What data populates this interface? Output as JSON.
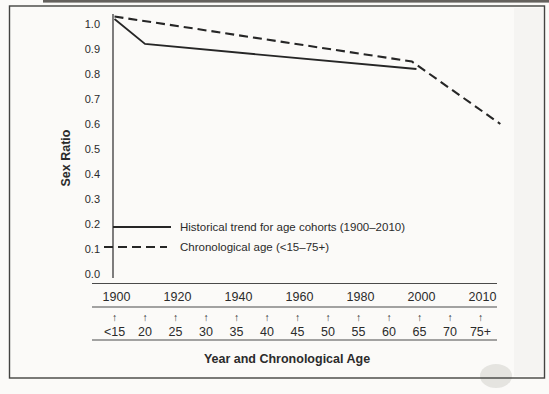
{
  "colors": {
    "ink": "#2b2b2b",
    "paper": "#fbfaf8"
  },
  "icons": {
    "up_arrow": "↑"
  },
  "chart_data": {
    "type": "line",
    "title": "",
    "ylabel": "Sex Ratio",
    "xlabel": "Year and Chronological Age",
    "ylim": [
      0.0,
      1.05
    ],
    "grid": false,
    "legend_position": "inside lower-left",
    "y_ticks": [
      {
        "label": "1.0",
        "value": 1.0
      },
      {
        "label": "0.9",
        "value": 0.9
      },
      {
        "label": "0.8",
        "value": 0.8
      },
      {
        "label": "0.7",
        "value": 0.7
      },
      {
        "label": "0.6",
        "value": 0.6
      },
      {
        "label": "0.5",
        "value": 0.5
      },
      {
        "label": "0.4",
        "value": 0.4
      },
      {
        "label": "0.3",
        "value": 0.3
      },
      {
        "label": "0.2",
        "value": 0.2
      },
      {
        "label": "0.1",
        "value": 0.1
      },
      {
        "label": "0.0",
        "value": 0.0
      }
    ],
    "x_axis": {
      "year_row": [
        {
          "label": "1900",
          "pos": 0
        },
        {
          "label": "1920",
          "pos": 2
        },
        {
          "label": "1940",
          "pos": 4
        },
        {
          "label": "1960",
          "pos": 6
        },
        {
          "label": "1980",
          "pos": 8
        },
        {
          "label": "2000",
          "pos": 10
        },
        {
          "label": "2010",
          "pos": 12
        }
      ],
      "age_row": [
        {
          "label": "<15",
          "pos": 0
        },
        {
          "label": "20",
          "pos": 1
        },
        {
          "label": "25",
          "pos": 2
        },
        {
          "label": "30",
          "pos": 3
        },
        {
          "label": "35",
          "pos": 4
        },
        {
          "label": "40",
          "pos": 5
        },
        {
          "label": "45",
          "pos": 6
        },
        {
          "label": "50",
          "pos": 7
        },
        {
          "label": "55",
          "pos": 8
        },
        {
          "label": "60",
          "pos": 9
        },
        {
          "label": "65",
          "pos": 10
        },
        {
          "label": "70",
          "pos": 11
        },
        {
          "label": "75+",
          "pos": 12
        }
      ]
    },
    "series": [
      {
        "name": "Historical trend for age cohorts (1900–2010)",
        "style": "solid",
        "points": [
          {
            "x_label": "1900",
            "pos": 0,
            "value": 1.02
          },
          {
            "x_label": "1910",
            "pos": 1,
            "value": 0.92
          },
          {
            "x_label": "2000",
            "pos": 9.9,
            "value": 0.82
          }
        ]
      },
      {
        "name": "Chronological age (<15–75+)",
        "style": "dashed",
        "points": [
          {
            "x_label": "<15 (1900)",
            "pos": 0,
            "value": 1.03
          },
          {
            "x_label": "65 (2000)",
            "pos": 9.75,
            "value": 0.85
          },
          {
            "x_label": "75+ (2010)",
            "pos": 12.65,
            "value": 0.6
          }
        ]
      }
    ]
  }
}
